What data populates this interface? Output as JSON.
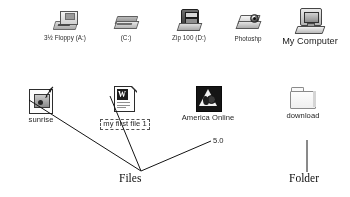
{
  "screen": {
    "title": "Windows desktop icons with handwritten annotations",
    "background": "#ffffff",
    "ink_color": "#101010"
  },
  "desktop": {
    "row_top": [
      {
        "id": "floppy-drive",
        "label": "3½ Floppy (A:)",
        "icon": "floppy-drive-icon",
        "label_size": "small"
      },
      {
        "id": "c-drive",
        "label": "(C:)",
        "icon": "hard-drive-icon",
        "label_size": "small"
      },
      {
        "id": "zip-drive",
        "label": "Zip 100 (D:)",
        "icon": "zip-drive-icon",
        "label_size": "small"
      },
      {
        "id": "photoshop",
        "label": "Photoshp",
        "icon": "photoshop-scanner-icon",
        "label_size": "small"
      },
      {
        "id": "my-computer",
        "label": "My Computer",
        "icon": "my-computer-icon",
        "label_size": "large"
      }
    ],
    "row_bottom": [
      {
        "id": "sunrise",
        "label": "sunrise",
        "icon": "image-file-icon",
        "label_size": "medium",
        "selected": false
      },
      {
        "id": "my-first-file",
        "label": "my first file 1",
        "icon": "word-document-icon",
        "label_size": "medium",
        "selected": true
      },
      {
        "id": "america-online",
        "label": "America Online",
        "label_line2": "5.0",
        "icon": "america-online-icon",
        "label_size": "medium",
        "selected": false
      },
      {
        "id": "download",
        "label": "download",
        "icon": "folder-icon",
        "label_size": "medium",
        "selected": false
      }
    ]
  },
  "annotations": [
    {
      "id": "files-callout",
      "text": "Files",
      "targets": [
        "sunrise",
        "my-first-file",
        "america-online"
      ]
    },
    {
      "id": "folder-callout",
      "text": "Folder",
      "targets": [
        "download"
      ]
    }
  ]
}
